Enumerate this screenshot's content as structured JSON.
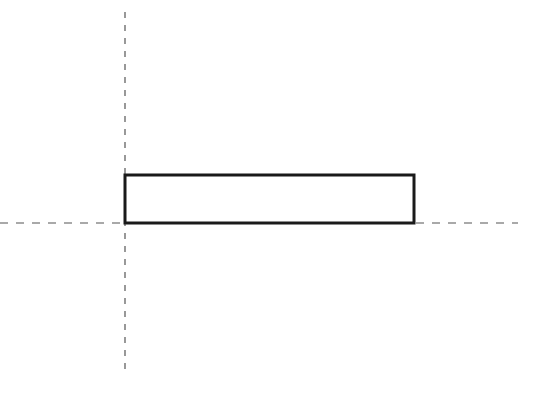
{
  "diagram": {
    "background": "#ffffff",
    "stroke_color": "#1a1a1a",
    "axis_color": "#555555",
    "rectangle": {
      "x": 125,
      "y": 175,
      "width": 289,
      "height": 48,
      "stroke_width": 3
    },
    "vertical_axis": {
      "x": 125,
      "y1": 12,
      "y2": 372,
      "dash": "6 7"
    },
    "horizontal_axis": {
      "y": 223,
      "x1": 0,
      "x2": 518,
      "dash": "8 8"
    }
  }
}
